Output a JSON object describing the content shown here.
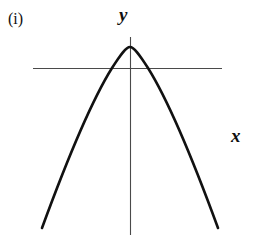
{
  "figure": {
    "part_label": "(i)",
    "background_color": "#ffffff",
    "width": 259,
    "height": 235
  },
  "axes": {
    "y_label": "y",
    "x_label": "x",
    "axis_color": "#4a4a4a",
    "axis_stroke_width": 1.1,
    "horizontal_axis": {
      "name": "x-axis",
      "y": 68,
      "x_start": 33,
      "x_end": 222
    },
    "vertical_axis": {
      "name": "y-axis",
      "x": 130,
      "y_start": 37,
      "y_end": 236
    }
  },
  "chart_data": {
    "type": "line",
    "title": "(i)",
    "xlabel": "x",
    "ylabel": "y",
    "grid": false,
    "legend": null,
    "curve_color": "#111111",
    "curve_stroke_width": 2.6,
    "series": [
      {
        "name": "parabola",
        "shape": "downward-opening parabola",
        "vertex": [
          130,
          47
        ],
        "x_intercepts": [
          100,
          160
        ],
        "endpoints": [
          [
            42,
            228
          ],
          [
            218,
            228
          ]
        ],
        "x": [
          42,
          54,
          66,
          78,
          90,
          100,
          112,
          124,
          130,
          136,
          148,
          160,
          172,
          184,
          196,
          208,
          218
        ],
        "y": [
          228,
          194,
          163,
          136,
          112,
          98,
          73,
          53,
          47,
          53,
          73,
          98,
          126,
          157,
          190,
          220,
          228
        ],
        "path": "M 42,228 C 64,168 92,100 112,68 C 121,54 126,47 130,47 C 134,47 139,54 148,68 C 168,100 196,168 218,228"
      }
    ],
    "xlim": [
      33,
      222
    ],
    "ylim": [
      236,
      37
    ]
  }
}
